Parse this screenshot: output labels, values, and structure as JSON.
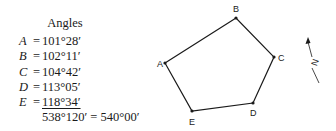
{
  "angles_table": {
    "title": "Angles",
    "rows": [
      {
        "var": "A",
        "eq": "=",
        "value": "101°28′"
      },
      {
        "var": "B",
        "eq": "=",
        "value": "102°11′"
      },
      {
        "var": "C",
        "eq": "=",
        "value": "104°42′"
      },
      {
        "var": "D",
        "eq": "=",
        "value": "113°05′"
      },
      {
        "var": "E",
        "eq": "=",
        "value": "118°34′"
      }
    ],
    "sum": "538°120′ = 540°00′"
  },
  "polygon": {
    "vertices": [
      {
        "label": "A",
        "x": 165,
        "y": 63
      },
      {
        "label": "B",
        "x": 236,
        "y": 18
      },
      {
        "label": "C",
        "x": 274,
        "y": 57
      },
      {
        "label": "D",
        "x": 253,
        "y": 103
      },
      {
        "label": "E",
        "x": 192,
        "y": 111
      }
    ]
  },
  "north_arrow": {
    "label": "N"
  },
  "colors": {
    "line": "#1a1a1a",
    "background": "#ffffff"
  }
}
